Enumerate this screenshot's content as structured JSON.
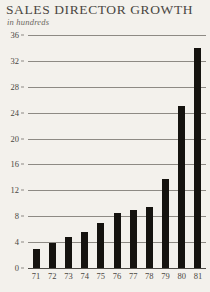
{
  "chart_data": {
    "type": "bar",
    "title": "SALES DIRECTOR GROWTH",
    "subtitle": "in hundreds",
    "xlabel": "",
    "ylabel": "",
    "categories": [
      "71",
      "72",
      "73",
      "74",
      "75",
      "76",
      "77",
      "78",
      "79",
      "80",
      "81"
    ],
    "values": [
      3,
      3.8,
      4.8,
      5.5,
      7,
      8.5,
      9,
      9.5,
      13.8,
      25,
      34
    ],
    "ylim": [
      0,
      36
    ],
    "y_ticks": [
      0,
      4,
      8,
      12,
      16,
      20,
      24,
      28,
      32,
      36
    ],
    "y_tick_labels": [
      "0",
      "4",
      "8",
      "12",
      "16",
      "20",
      "24",
      "28",
      "32",
      "36"
    ],
    "grid": true,
    "legend": false,
    "bar_color": "#15130f",
    "background_color": "#f3f1ec",
    "gridline_color": "#8d8a84",
    "text_color": "#4a4742"
  }
}
